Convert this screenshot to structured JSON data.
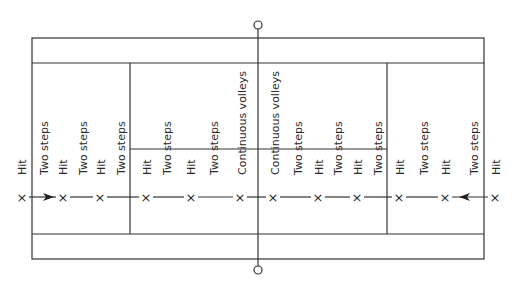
{
  "diagram": {
    "colors": {
      "line": "#333333",
      "background": "#ffffff"
    },
    "court": {
      "outer": {
        "x1": 32,
        "y1": 38,
        "x2": 484,
        "y2": 259
      },
      "inner_top_y": 63,
      "inner_bottom_y": 234,
      "service_left_x": 130,
      "service_right_x": 387,
      "center_line_y": 149,
      "net_x": 258,
      "net_post_top_y": 25,
      "net_post_bottom_y": 270
    },
    "marker_row_y": 197,
    "label_baseline_y": 175,
    "markers": [
      {
        "x": 22,
        "symbol": "×"
      },
      {
        "x": 63,
        "symbol": "×"
      },
      {
        "x": 100,
        "symbol": "×"
      },
      {
        "x": 146,
        "symbol": "×"
      },
      {
        "x": 191,
        "symbol": "×"
      },
      {
        "x": 240,
        "symbol": "×"
      },
      {
        "x": 273,
        "symbol": "×"
      },
      {
        "x": 318,
        "symbol": "×"
      },
      {
        "x": 357,
        "symbol": "×"
      },
      {
        "x": 399,
        "symbol": "×"
      },
      {
        "x": 445,
        "symbol": "×"
      },
      {
        "x": 495,
        "symbol": "×"
      }
    ],
    "arrows": [
      {
        "from": 29,
        "to": 56,
        "direction": "right"
      },
      {
        "from": 451,
        "to": 488,
        "direction": "left"
      }
    ],
    "labels": [
      {
        "x": 22,
        "text": "Hit"
      },
      {
        "x": 44,
        "text": "Two steps"
      },
      {
        "x": 63,
        "text": "Hit"
      },
      {
        "x": 83,
        "text": "Two steps"
      },
      {
        "x": 101,
        "text": "Hit"
      },
      {
        "x": 121,
        "text": "Two steps"
      },
      {
        "x": 147,
        "text": "Hit"
      },
      {
        "x": 167,
        "text": "Two steps"
      },
      {
        "x": 191,
        "text": "Hit"
      },
      {
        "x": 214,
        "text": "Two steps"
      },
      {
        "x": 242,
        "text": "Continuous volleys"
      },
      {
        "x": 275,
        "text": "Continuous volleys"
      },
      {
        "x": 298,
        "text": "Two steps"
      },
      {
        "x": 319,
        "text": "Hit"
      },
      {
        "x": 338,
        "text": "Two steps"
      },
      {
        "x": 358,
        "text": "Hit"
      },
      {
        "x": 378,
        "text": "Two steps"
      },
      {
        "x": 400,
        "text": "Hit"
      },
      {
        "x": 424,
        "text": "Two steps"
      },
      {
        "x": 446,
        "text": "Hit"
      },
      {
        "x": 474,
        "text": "Two steps"
      },
      {
        "x": 496,
        "text": "Hit"
      }
    ]
  }
}
